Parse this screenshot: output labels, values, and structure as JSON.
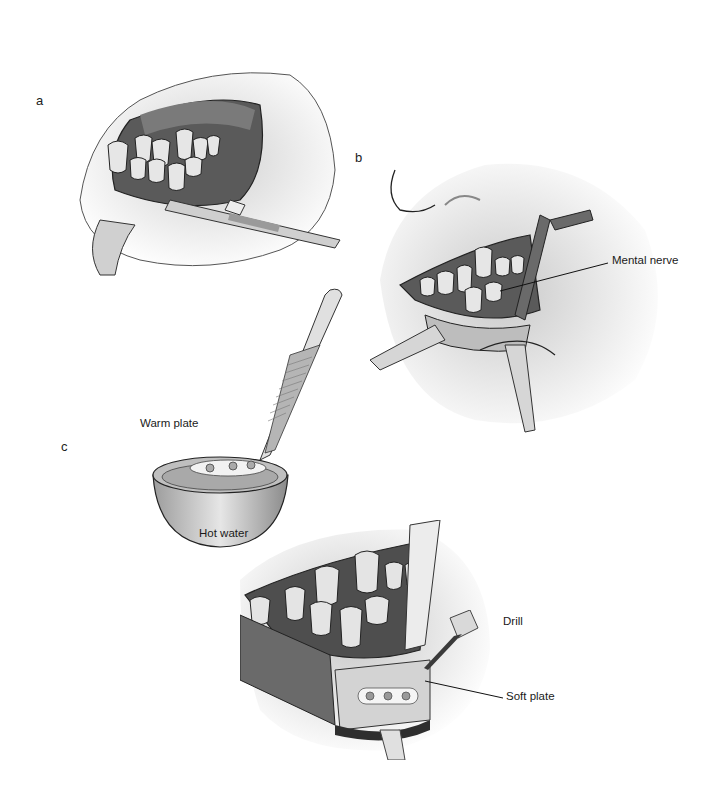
{
  "figure": {
    "panels": [
      {
        "id": "a",
        "letter": "a",
        "description": "Retracted lower lip exposing teeth, incision with forceps"
      },
      {
        "id": "b",
        "letter": "b",
        "description": "Exposure of mandible with retractors",
        "callouts": [
          "Mental nerve"
        ]
      },
      {
        "id": "c",
        "letter": "c",
        "description": "Warming plate in hot water and fixation with drill",
        "callouts": [
          "Warm plate",
          "Hot water",
          "Drill",
          "Soft plate"
        ]
      }
    ],
    "labels": {
      "a": "a",
      "b": "b",
      "c": "c",
      "mental_nerve": "Mental nerve",
      "warm_plate": "Warm plate",
      "hot_water": "Hot water",
      "drill": "Drill",
      "soft_plate": "Soft plate"
    },
    "colors": {
      "background": "#ffffff",
      "tissue_light": "#d9d9d9",
      "tissue_mid": "#a6a6a6",
      "tissue_dark": "#4a4a4a",
      "tooth": "#e8e8e8",
      "outline": "#1f1f1f",
      "instrument": "#c8c8c8"
    }
  }
}
